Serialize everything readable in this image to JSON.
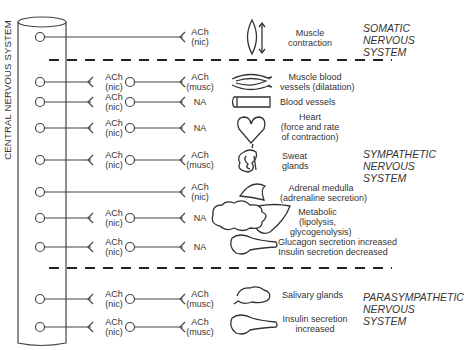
{
  "cns_label": "CENTRAL NERVOUS SYSTEM",
  "systems": {
    "somatic": [
      "SOMATIC",
      "NERVOUS",
      "SYSTEM"
    ],
    "sympathetic": [
      "SYMPATHETIC",
      "NERVOUS",
      "SYSTEM"
    ],
    "parasympathetic": [
      "PARASYMPATHETIC",
      "NERVOUS",
      "SYSTEM"
    ]
  },
  "rows": [
    {
      "pre": null,
      "post": [
        "ACh",
        "(nic)"
      ],
      "organ_icon": "skeletal-muscle-icon",
      "effect": [
        "Muscle",
        "contraction"
      ]
    },
    {
      "pre": [
        "ACh",
        "(nic)"
      ],
      "post": [
        "ACh",
        "(musc)"
      ],
      "organ_icon": "muscle-blood-vessel-icon",
      "effect": [
        "Muscle blood",
        "vessels (dilatation)"
      ]
    },
    {
      "pre": [
        "ACh",
        "(nic)"
      ],
      "post": [
        "NA"
      ],
      "organ_icon": "blood-vessel-icon",
      "effect": [
        "Blood vessels"
      ]
    },
    {
      "pre": [
        "ACh",
        "(nic)"
      ],
      "post": [
        "NA"
      ],
      "organ_icon": "heart-icon",
      "effect": [
        "Heart",
        "(force and rate",
        "of contraction)"
      ]
    },
    {
      "pre": [
        "ACh",
        "(nic)"
      ],
      "post": [
        "ACh",
        "(musc)"
      ],
      "organ_icon": "sweat-gland-icon",
      "effect": [
        "Sweat",
        "glands"
      ]
    },
    {
      "pre": null,
      "post": [
        "ACh",
        "(nic)"
      ],
      "organ_icon": "adrenal-medulla-icon",
      "effect": [
        "Adrenal medulla",
        "(adrenaline secretion)"
      ]
    },
    {
      "pre": [
        "ACh",
        "(nic)"
      ],
      "post": [
        "NA"
      ],
      "organ_icon": "liver-fat-icon",
      "effect": [
        "Metabolic",
        "(lipolysis,",
        "glycogenolysis)"
      ]
    },
    {
      "pre": [
        "ACh",
        "(nic)"
      ],
      "post": [
        "NA"
      ],
      "organ_icon": "pancreas-icon",
      "effect": [
        "Glucagon secretion increased",
        "Insulin secretion decreased"
      ]
    },
    {
      "pre": [
        "ACh",
        "(nic)"
      ],
      "post": [
        "ACh",
        "(musc)"
      ],
      "organ_icon": "salivary-gland-icon",
      "effect": [
        "Salivary glands"
      ]
    },
    {
      "pre": [
        "ACh",
        "(nic)"
      ],
      "post": [
        "ACh",
        "(musc)"
      ],
      "organ_icon": "pancreas-icon",
      "effect": [
        "Insulin secretion",
        "increased"
      ]
    }
  ]
}
